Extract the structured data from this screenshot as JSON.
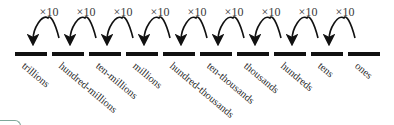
{
  "diagram": {
    "multiplier_label": "×10",
    "places": [
      "trillions",
      "hundred-millions",
      "ten-millions",
      "millions",
      "hundred-thousands",
      "ten-thousands",
      "thousands",
      "hundreds",
      "tens",
      "ones"
    ],
    "arrows": [
      {
        "from": "hundred-millions",
        "to": "trillions",
        "label": "×10"
      },
      {
        "from": "ten-millions",
        "to": "hundred-millions",
        "label": "×10"
      },
      {
        "from": "millions",
        "to": "ten-millions",
        "label": "×10"
      },
      {
        "from": "hundred-thousands",
        "to": "millions",
        "label": "×10"
      },
      {
        "from": "ten-thousands",
        "to": "hundred-thousands",
        "label": "×10"
      },
      {
        "from": "thousands",
        "to": "ten-thousands",
        "label": "×10"
      },
      {
        "from": "hundreds",
        "to": "thousands",
        "label": "×10"
      },
      {
        "from": "tens",
        "to": "hundreds",
        "label": "×10"
      },
      {
        "from": "ones",
        "to": "tens",
        "label": "×10"
      }
    ],
    "colors": {
      "bar": "#111111",
      "text": "#2a2a2a",
      "corner_accent": "#7fa79a"
    }
  }
}
